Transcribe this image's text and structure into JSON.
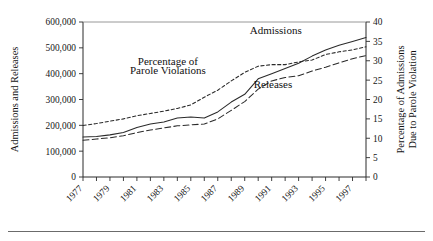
{
  "chart_data": {
    "type": "line",
    "title": "",
    "xlabel": "",
    "ylabel": "Admissions and Releases",
    "ylabel_right": "Percentage of Admissions Due to Parole Violation",
    "ylabel_right_line1": "Percentage of Admissions",
    "ylabel_right_line2": "Due to Parole Violation",
    "grid": false,
    "legend_position": "inline-annotations",
    "x": [
      1977,
      1978,
      1979,
      1980,
      1981,
      1982,
      1983,
      1984,
      1985,
      1986,
      1987,
      1988,
      1989,
      1990,
      1991,
      1992,
      1993,
      1994,
      1995,
      1996,
      1997,
      1998
    ],
    "xlim": [
      1977,
      1998
    ],
    "ylim": [
      0,
      600000
    ],
    "ylim_right": [
      0,
      40
    ],
    "ytick_values": [
      0,
      100000,
      200000,
      300000,
      400000,
      500000,
      600000
    ],
    "ytick_labels": [
      "0",
      "100,000",
      "200,000",
      "300,000",
      "400,000",
      "500,000",
      "600,000"
    ],
    "ytick_right_values": [
      0,
      5,
      10,
      15,
      20,
      25,
      30,
      35,
      40
    ],
    "ytick_right_labels": [
      "0",
      "5",
      "10",
      "15",
      "20",
      "25",
      "30",
      "35",
      "40"
    ],
    "xtick_values": [
      1977,
      1978,
      1979,
      1980,
      1981,
      1982,
      1983,
      1984,
      1985,
      1986,
      1987,
      1988,
      1989,
      1990,
      1991,
      1992,
      1993,
      1994,
      1995,
      1996,
      1997,
      1998
    ],
    "xtick_labels_shown": [
      "1977",
      "1979",
      "1981",
      "1983",
      "1985",
      "1987",
      "1989",
      "1991",
      "1993",
      "1995",
      "1997"
    ],
    "xtick_label_years": [
      1977,
      1979,
      1981,
      1983,
      1985,
      1987,
      1989,
      1991,
      1993,
      1995,
      1997
    ],
    "series": [
      {
        "name": "Admissions",
        "axis": "left",
        "style": "solid",
        "label_x": 1991.3,
        "label_y": 555000,
        "values": [
          155000,
          157000,
          163000,
          172000,
          192000,
          205000,
          213000,
          228000,
          232000,
          228000,
          252000,
          290000,
          320000,
          380000,
          400000,
          420000,
          440000,
          468000,
          492000,
          510000,
          525000,
          540000
        ]
      },
      {
        "name": "Releases",
        "axis": "left",
        "style": "dashed",
        "label_x": 1991.1,
        "label_y": 345000,
        "values": [
          142000,
          147000,
          152000,
          160000,
          172000,
          182000,
          190000,
          198000,
          202000,
          205000,
          225000,
          258000,
          292000,
          340000,
          372000,
          385000,
          392000,
          410000,
          425000,
          442000,
          458000,
          470000
        ]
      },
      {
        "name": "Percentage of Parole Violations",
        "axis": "right",
        "style": "dotted",
        "label_x": 1983.3,
        "label_y_left": 420000,
        "values": [
          13.3,
          13.8,
          14.4,
          15.0,
          15.8,
          16.4,
          17.0,
          17.7,
          18.6,
          20.6,
          22.4,
          24.8,
          27.0,
          28.6,
          29.0,
          29.0,
          29.7,
          30.2,
          31.6,
          32.3,
          32.8,
          33.6
        ]
      }
    ],
    "annotations": [
      {
        "text": "Admissions",
        "x": 1991.3,
        "y": 555000
      },
      {
        "text": "Releases",
        "x": 1991.1,
        "y": 345000
      },
      {
        "text": "Percentage of",
        "x": 1983.3,
        "y": 432000
      },
      {
        "text": "Parole Violations",
        "x": 1983.3,
        "y": 398000
      }
    ]
  },
  "labels": {
    "y_axis_left": "Admissions and Releases",
    "y_axis_right_line1": "Percentage of Admissions",
    "y_axis_right_line2": "Due to Parole Violation",
    "annotation_admissions": "Admissions",
    "annotation_releases": "Releases",
    "annotation_percentage_line1": "Percentage of",
    "annotation_percentage_line2": "Parole Violations"
  },
  "colors": {
    "ink": "#1a1a1a",
    "axis": "#2b2b2b",
    "series": "#2a2a2a",
    "rule": "#6b6b6b",
    "background": "#ffffff"
  }
}
